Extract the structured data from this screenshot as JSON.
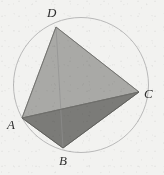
{
  "figure": {
    "kind": "geometry-diagram",
    "background_color": "#f2f2f0",
    "circle": {
      "name": "circumscribed-circle",
      "cx": 81,
      "cy": 85,
      "r": 67.5,
      "stroke_color": "#b9b9b9",
      "stroke_width": 1,
      "fill": "none"
    },
    "vertices": [
      {
        "id": "D",
        "label": "D",
        "x": 56,
        "y": 27,
        "label_x": 47,
        "label_y": 6
      },
      {
        "id": "C",
        "label": "C",
        "x": 139,
        "y": 92,
        "label_x": 144,
        "label_y": 87
      },
      {
        "id": "A",
        "label": "A",
        "x": 22,
        "y": 118,
        "label_x": 7,
        "label_y": 118
      },
      {
        "id": "B",
        "label": "B",
        "x": 63,
        "y": 148,
        "label_x": 59,
        "label_y": 154
      }
    ],
    "faces": [
      {
        "id": "face-DAC",
        "name": "upper-light-face",
        "points": "56,27 139,92 22,118",
        "fill_color": "#a9a9a6",
        "stroke_color": "#8e8e8b"
      },
      {
        "id": "face-ABC",
        "name": "lower-dark-face",
        "points": "22,118 63,148 139,92",
        "fill_color": "#7b7b78",
        "stroke_color": "#666663"
      }
    ],
    "edges": [
      {
        "id": "edge-DA",
        "from": "D",
        "to": "A",
        "x1": 56,
        "y1": 27,
        "x2": 22,
        "y2": 118,
        "style": "solid",
        "color": "#6e6e6b"
      },
      {
        "id": "edge-DC",
        "from": "D",
        "to": "C",
        "x1": 56,
        "y1": 27,
        "x2": 139,
        "y2": 92,
        "style": "solid",
        "color": "#6e6e6b"
      },
      {
        "id": "edge-AC",
        "from": "A",
        "to": "C",
        "x1": 22,
        "y1": 118,
        "x2": 139,
        "y2": 92,
        "style": "solid",
        "color": "#6e6e6b"
      },
      {
        "id": "edge-AB",
        "from": "A",
        "to": "B",
        "x1": 22,
        "y1": 118,
        "x2": 63,
        "y2": 148,
        "style": "solid",
        "color": "#5d5d5a"
      },
      {
        "id": "edge-BC",
        "from": "B",
        "to": "C",
        "x1": 63,
        "y1": 148,
        "x2": 139,
        "y2": 92,
        "style": "solid",
        "color": "#5d5d5a"
      },
      {
        "id": "edge-DB",
        "from": "D",
        "to": "B",
        "x1": 56,
        "y1": 27,
        "x2": 63,
        "y2": 148,
        "style": "hidden-faint",
        "color": "#909090"
      }
    ]
  }
}
